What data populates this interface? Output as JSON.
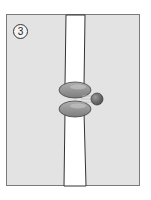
{
  "figure": {
    "step_label": "3",
    "colors": {
      "background": "#e3e3e3",
      "frame": "#7a7a7a",
      "membrane_channel": "#ffffff",
      "channel_outline": "#333333",
      "protein_subunit": "#8f8f8f",
      "ligand_ball": "#6e6e6e"
    },
    "elements": [
      {
        "name": "membrane-channel",
        "description": "vertical white tube"
      },
      {
        "name": "upper-protein-subunit",
        "description": "grey oval"
      },
      {
        "name": "lower-protein-subunit",
        "description": "grey oval"
      },
      {
        "name": "ligand-ball",
        "description": "dark grey sphere with motion lines"
      }
    ]
  }
}
